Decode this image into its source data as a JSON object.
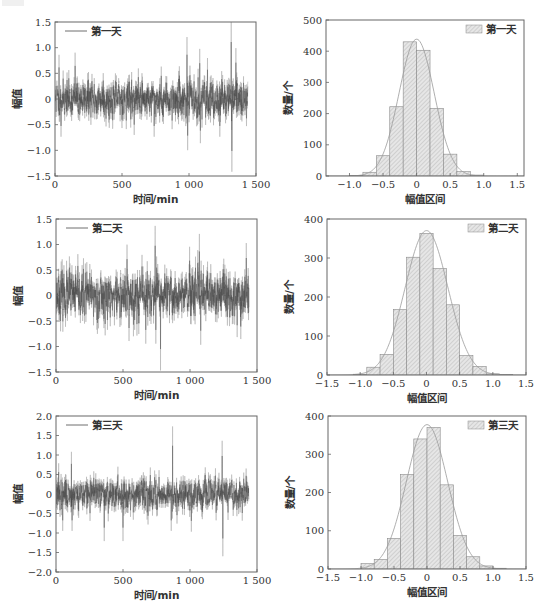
{
  "chart_data": [
    {
      "id": "ts1",
      "type": "line",
      "title": "",
      "legend": "第一天",
      "xlabel": "时间/min",
      "ylabel": "幅值",
      "xlim": [
        0,
        1500
      ],
      "ylim": [
        -1.5,
        1.5
      ],
      "xticks": [
        0,
        500,
        1000,
        1500
      ],
      "xtick_labels": [
        "0",
        "500",
        "1 000",
        "1 500"
      ],
      "yticks": [
        -1.5,
        -1.0,
        -0.5,
        0,
        0.5,
        1.0,
        1.5
      ],
      "ytick_labels": [
        "−1.5",
        "−1.0",
        "−0.5",
        "0",
        "0.5",
        "1.0",
        "1.5"
      ],
      "n_points": 1440,
      "noise_std": 0.2,
      "seed": 11,
      "spikes": [
        [
          30,
          0.82
        ],
        [
          45,
          -0.7
        ],
        [
          150,
          0.86
        ],
        [
          360,
          0.48
        ],
        [
          740,
          -0.7
        ],
        [
          985,
          1.15
        ],
        [
          990,
          -0.95
        ],
        [
          1080,
          0.93
        ],
        [
          1085,
          -0.82
        ],
        [
          1230,
          -0.7
        ],
        [
          1315,
          1.48
        ],
        [
          1320,
          -1.35
        ]
      ],
      "legend_position": "upper left",
      "grid": false
    },
    {
      "id": "hist1",
      "type": "bar",
      "title": "",
      "legend": "第一天",
      "xlabel": "幅值区间",
      "ylabel": "数量/个",
      "xlim": [
        -1.35,
        1.6
      ],
      "ylim": [
        0,
        500
      ],
      "xticks": [
        -1.0,
        -0.5,
        0,
        0.5,
        1.0,
        1.5
      ],
      "xtick_labels": [
        "−1.0",
        "−0.5",
        "0",
        "0.5",
        "1.0",
        "1.5"
      ],
      "yticks": [
        0,
        100,
        200,
        300,
        400,
        500
      ],
      "ytick_labels": [
        "0",
        "100",
        "200",
        "300",
        "400",
        "500"
      ],
      "bin_edges": [
        -1.0,
        -0.8,
        -0.6,
        -0.4,
        -0.2,
        0.0,
        0.2,
        0.4,
        0.6,
        0.8,
        1.0
      ],
      "values": [
        2,
        12,
        65,
        222,
        430,
        403,
        217,
        70,
        14,
        3
      ],
      "fit_curve": "normal",
      "legend_position": "upper right",
      "grid": false
    },
    {
      "id": "ts2",
      "type": "line",
      "title": "",
      "legend": "第二天",
      "xlabel": "时间/min",
      "ylabel": "幅值",
      "xlim": [
        0,
        1500
      ],
      "ylim": [
        -1.5,
        1.5
      ],
      "xticks": [
        0,
        500,
        1000,
        1500
      ],
      "xtick_labels": [
        "0",
        "500",
        "1 000",
        "1 500"
      ],
      "yticks": [
        -1.5,
        -1.0,
        -0.5,
        0,
        0.5,
        1.0,
        1.5
      ],
      "ytick_labels": [
        "−1.5",
        "−1.0",
        "−0.5",
        "0",
        "0.5",
        "1.0",
        "1.5"
      ],
      "n_points": 1440,
      "noise_std": 0.25,
      "seed": 23,
      "spikes": [
        [
          20,
          0.5
        ],
        [
          100,
          0.73
        ],
        [
          530,
          0.95
        ],
        [
          545,
          -0.85
        ],
        [
          670,
          -0.9
        ],
        [
          740,
          1.3
        ],
        [
          745,
          -0.9
        ],
        [
          780,
          -1.4
        ],
        [
          1070,
          1.15
        ],
        [
          1080,
          -0.92
        ],
        [
          1420,
          0.98
        ]
      ],
      "legend_position": "upper left",
      "grid": false
    },
    {
      "id": "hist2",
      "type": "bar",
      "title": "",
      "legend": "第二天",
      "xlabel": "幅值区间",
      "ylabel": "数量/个",
      "xlim": [
        -1.5,
        1.5
      ],
      "ylim": [
        0,
        400
      ],
      "xticks": [
        -1.5,
        -1.0,
        -0.5,
        0,
        0.5,
        1.0,
        1.5
      ],
      "xtick_labels": [
        "−1.5",
        "−1.0",
        "−0.5",
        "0",
        "0.5",
        "1.0",
        "1.5"
      ],
      "yticks": [
        0,
        100,
        200,
        300,
        400
      ],
      "ytick_labels": [
        "0",
        "100",
        "200",
        "300",
        "400"
      ],
      "bin_edges": [
        -1.1,
        -0.9,
        -0.7,
        -0.5,
        -0.3,
        -0.1,
        0.1,
        0.3,
        0.5,
        0.7,
        0.9,
        1.1,
        1.3
      ],
      "values": [
        2,
        20,
        53,
        168,
        302,
        363,
        273,
        180,
        50,
        22,
        3,
        1
      ],
      "fit_curve": "normal",
      "legend_position": "upper right",
      "grid": false
    },
    {
      "id": "ts3",
      "type": "line",
      "title": "",
      "legend": "第三天",
      "xlabel": "时间/min",
      "ylabel": "幅值",
      "xlim": [
        0,
        1500
      ],
      "ylim": [
        -2.0,
        2.0
      ],
      "xticks": [
        0,
        500,
        1000,
        1500
      ],
      "xtick_labels": [
        "0",
        "500",
        "1 000",
        "1 500"
      ],
      "yticks": [
        -2.0,
        -1.5,
        -1.0,
        -0.5,
        0,
        0.5,
        1.0,
        1.5,
        2.0
      ],
      "ytick_labels": [
        "−2.0",
        "−1.5",
        "−1.0",
        "−0.5",
        "0",
        "0.5",
        "1.0",
        "1.5",
        "2.0"
      ],
      "n_points": 1440,
      "noise_std": 0.22,
      "seed": 37,
      "spikes": [
        [
          20,
          0.75
        ],
        [
          50,
          -0.9
        ],
        [
          115,
          1.03
        ],
        [
          120,
          -0.9
        ],
        [
          360,
          -1.15
        ],
        [
          500,
          -1.15
        ],
        [
          870,
          1.65
        ],
        [
          860,
          -0.9
        ],
        [
          1010,
          -0.92
        ],
        [
          1240,
          1.3
        ],
        [
          1245,
          -1.52
        ]
      ],
      "legend_position": "upper left",
      "grid": false
    },
    {
      "id": "hist3",
      "type": "bar",
      "title": "",
      "legend": "第三天",
      "xlabel": "幅值区间",
      "ylabel": "数量/个",
      "xlim": [
        -1.5,
        1.5
      ],
      "ylim": [
        0,
        400
      ],
      "xticks": [
        -1.5,
        -1.0,
        -0.5,
        0,
        0.5,
        1.0,
        1.5
      ],
      "xtick_labels": [
        "−1.5",
        "−1.0",
        "−0.5",
        "0",
        "0.5",
        "1.0",
        "1.5"
      ],
      "yticks": [
        0,
        100,
        200,
        300,
        400
      ],
      "ytick_labels": [
        "0",
        "100",
        "200",
        "300",
        "400"
      ],
      "bin_edges": [
        -1.0,
        -0.8,
        -0.6,
        -0.4,
        -0.2,
        0.0,
        0.2,
        0.4,
        0.6,
        0.8,
        1.0,
        1.2
      ],
      "values": [
        14,
        25,
        80,
        247,
        340,
        370,
        220,
        88,
        32,
        8,
        2
      ],
      "fit_curve": "normal",
      "legend_position": "upper right",
      "grid": false
    }
  ],
  "layout": {
    "panels": [
      {
        "chart": 0,
        "frame": [
          55,
          22,
          256,
          176
        ]
      },
      {
        "chart": 1,
        "frame": [
          326,
          20,
          524,
          176
        ]
      },
      {
        "chart": 2,
        "frame": [
          56,
          219,
          257,
          372
        ]
      },
      {
        "chart": 3,
        "frame": [
          327,
          219,
          526,
          375
        ]
      },
      {
        "chart": 4,
        "frame": [
          56,
          416,
          257,
          572
        ]
      },
      {
        "chart": 5,
        "frame": [
          328,
          416,
          526,
          569
        ]
      }
    ]
  },
  "colors": {
    "frame": "#666666",
    "series_dark": "#4a4a4a",
    "series_light": "#a8a8a8",
    "bar_fill": "#e4e4e4",
    "bar_hatch": "#b0b0b0",
    "bar_edge": "#8a8a8a",
    "fit_curve": "#9a9a9a",
    "text": "#333333"
  }
}
